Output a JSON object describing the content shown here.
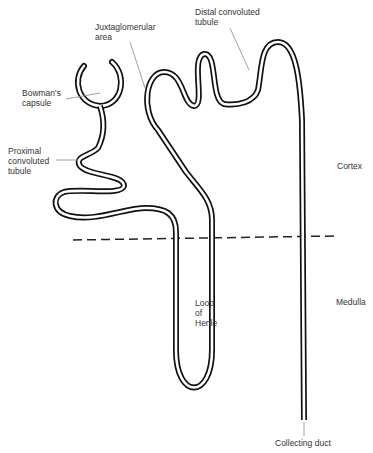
{
  "labels": {
    "juxtaglomerular": "Juxtaglomerular\narea",
    "distal": "Distal convoluted\ntubule",
    "bowman": "Bowman's\ncapsule",
    "proximal": "Proximal\nconvoluted\ntubule",
    "cortex": "Cortex",
    "medulla": "Medulla",
    "loop": "Loop\nof\nHenle",
    "collecting": "Collecting duct"
  },
  "colors": {
    "tubule": "#111111",
    "leader": "#888888",
    "text": "#333333"
  }
}
